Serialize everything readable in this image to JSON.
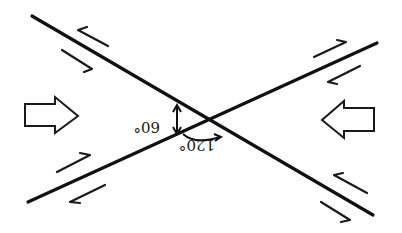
{
  "diagram": {
    "type": "conjugate shear faults",
    "colors": {
      "line": "#111111",
      "background": "#ffffff"
    },
    "faults": [
      {
        "name": "fault-descending",
        "from": [
          32,
          16
        ],
        "to": [
          373,
          215
        ]
      },
      {
        "name": "fault-ascending",
        "from": [
          28,
          202
        ],
        "to": [
          377,
          43
        ]
      }
    ],
    "angles": {
      "acute": {
        "label": "60°",
        "rotated": 180
      },
      "obtuse": {
        "label": "120°",
        "rotated": 180
      }
    },
    "stress_arrows": [
      {
        "name": "left-compression-arrow",
        "direction": "right"
      },
      {
        "name": "right-compression-arrow",
        "direction": "left"
      }
    ]
  }
}
